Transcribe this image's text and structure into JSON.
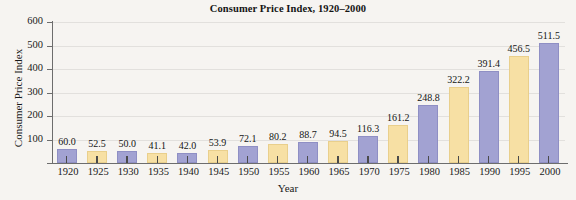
{
  "chart_data": {
    "type": "bar",
    "title": "Consumer Price Index, 1920–2000",
    "xlabel": "Year",
    "ylabel": "Consumer Price Index",
    "categories": [
      "1920",
      "1925",
      "1930",
      "1935",
      "1940",
      "1945",
      "1950",
      "1955",
      "1960",
      "1965",
      "1970",
      "1975",
      "1980",
      "1985",
      "1990",
      "1995",
      "2000"
    ],
    "values": [
      60.0,
      52.5,
      50.0,
      41.1,
      42.0,
      53.9,
      72.1,
      80.2,
      88.7,
      94.5,
      116.3,
      161.2,
      248.8,
      322.2,
      391.4,
      456.5,
      511.5
    ],
    "value_labels": [
      "60.0",
      "52.5",
      "50.0",
      "41.1",
      "42.0",
      "53.9",
      "72.1",
      "80.2",
      "88.7",
      "94.5",
      "116.3",
      "161.2",
      "248.8",
      "322.2",
      "391.4",
      "456.5",
      "511.5"
    ],
    "bar_colors": [
      "blue",
      "yellow",
      "blue",
      "yellow",
      "blue",
      "yellow",
      "blue",
      "yellow",
      "blue",
      "yellow",
      "blue",
      "yellow",
      "blue",
      "yellow",
      "blue",
      "yellow",
      "blue"
    ],
    "ylim": [
      0,
      600
    ],
    "yticks": [
      100,
      200,
      300,
      400,
      500,
      600
    ],
    "ytick_labels": [
      "100",
      "200",
      "300",
      "400",
      "500",
      "600"
    ],
    "grid": true,
    "legend": "none",
    "colors": {
      "blue": "#a2a2d2",
      "yellow": "#f7e0a4",
      "axis": "#6d6d6d",
      "grid": "#e2e0dd",
      "background": "#f6f4f1",
      "text": "#1a1a1a"
    }
  }
}
